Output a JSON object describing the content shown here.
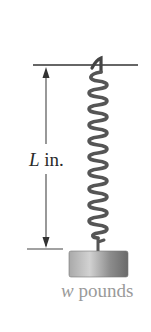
{
  "figure": {
    "length_label": {
      "variable": "L",
      "unit": "in."
    },
    "weight_label": {
      "variable": "w",
      "unit": "pounds"
    },
    "spring": {
      "coil_count": 20
    },
    "colors": {
      "lines": "#333333",
      "spring": "#555555",
      "weight_dark": "#6e6e6e",
      "weight_light": "#d0d0d0",
      "weight_text": "#9a9a9a"
    }
  }
}
